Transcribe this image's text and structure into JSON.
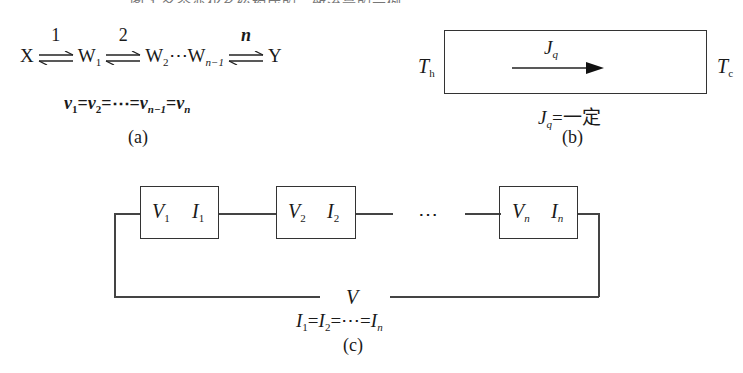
{
  "header": {
    "truncated_caption": "图 1  各个变化系统构成的一致流量的示例"
  },
  "part_a": {
    "species": [
      "X",
      "W",
      "W",
      "W",
      "Y"
    ],
    "reaction_labels": [
      "1",
      "2",
      "n"
    ],
    "subscripts": [
      "1",
      "2",
      "n−1"
    ],
    "ellipsis": "⋯",
    "constraint": {
      "v": "v",
      "s1": "1",
      "s2": "2",
      "sn1": "n−1",
      "sn": "n",
      "eq": "=",
      "dots": "⋯"
    },
    "caption": "(a)"
  },
  "part_b": {
    "left_label": {
      "main": "T",
      "sub": "h"
    },
    "right_label": {
      "main": "T",
      "sub": "c"
    },
    "flux_label": {
      "main": "J",
      "sub": "q"
    },
    "condition": {
      "main": "J",
      "sub": "q",
      "rest": "=一定"
    },
    "caption": "(b)"
  },
  "part_c": {
    "elements": [
      {
        "v": "V",
        "v_sub": "1",
        "i": "I",
        "i_sub": "1"
      },
      {
        "v": "V",
        "v_sub": "2",
        "i": "I",
        "i_sub": "2"
      },
      {
        "v": "V",
        "v_sub": "n",
        "i": "I",
        "i_sub": "n"
      }
    ],
    "ellipsis": "⋯",
    "total_voltage": "V",
    "condition": {
      "i": "I",
      "s1": "1",
      "s2": "2",
      "sn": "n",
      "eq": "=",
      "dots": "⋯"
    },
    "caption": "(c)"
  }
}
